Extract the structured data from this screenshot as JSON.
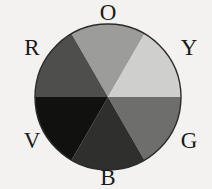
{
  "figure": {
    "background_color": "#f3f2f0",
    "label_color": "#1a1a18"
  },
  "wheel": {
    "center_x": 108,
    "center_y": 97,
    "radius": 73,
    "sector_count": 6,
    "sector_span_degrees": 60,
    "outline_color": "#2b2b29"
  },
  "chart_data": {
    "type": "pie",
    "title": "",
    "categories": [
      "O",
      "Y",
      "G",
      "B",
      "V",
      "R"
    ],
    "values": [
      60,
      60,
      60,
      60,
      60,
      60
    ],
    "legend_position": "around-perimeter",
    "grid": false,
    "sectors": [
      {
        "label": "O",
        "name": "orange",
        "color": "#9c9c9a",
        "start_angle": -30,
        "end_angle": 30,
        "label_position": "top"
      },
      {
        "label": "Y",
        "name": "yellow",
        "color": "#cfcfcd",
        "start_angle": 30,
        "end_angle": 90,
        "label_position": "upper-right"
      },
      {
        "label": "G",
        "name": "green",
        "color": "#6e6e6c",
        "start_angle": 90,
        "end_angle": 150,
        "label_position": "lower-right"
      },
      {
        "label": "B",
        "name": "blue",
        "color": "#2f2f2d",
        "start_angle": 150,
        "end_angle": 210,
        "label_position": "bottom"
      },
      {
        "label": "V",
        "name": "violet",
        "color": "#111110",
        "start_angle": 210,
        "end_angle": 270,
        "label_position": "lower-left"
      },
      {
        "label": "R",
        "name": "red",
        "color": "#4e4e4c",
        "start_angle": 270,
        "end_angle": 330,
        "label_position": "upper-left"
      }
    ]
  },
  "labels": {
    "o": "O",
    "r": "R",
    "y": "Y",
    "v": "V",
    "g": "G",
    "b": "B"
  }
}
